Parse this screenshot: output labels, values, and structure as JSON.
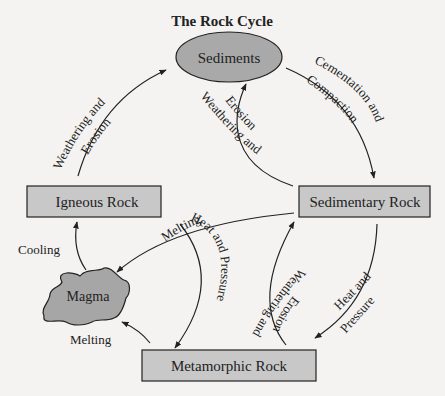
{
  "title": "The Rock Cycle",
  "nodes": {
    "sediments": "Sediments",
    "igneous": "Igneous Rock",
    "sedimentary": "Sedimentary Rock",
    "magma": "Magma",
    "metamorphic": "Metamorphic Rock"
  },
  "edges": {
    "igneous_to_sediments": [
      "Weathering and",
      "Erosion"
    ],
    "sediments_to_sedimentary": [
      "Cementation and",
      "Compaction"
    ],
    "sedimentary_to_sediments": [
      "Weathering and",
      "Erosion"
    ],
    "sedimentary_to_magma": "Melting",
    "igneous_to_metamorphic": "Heat and Pressure",
    "metamorphic_to_sedimentary": [
      "Weathering and",
      "Erosion"
    ],
    "sedimentary_to_metamorphic": [
      "Heat and",
      "Pressure"
    ],
    "magma_to_igneous": "Cooling",
    "metamorphic_to_magma": "Melting"
  },
  "colors": {
    "node_fill": "#c8c8c8",
    "oval_fill": "#a9a9a9",
    "magma_fill": "#a6a6a6",
    "stroke": "#222222",
    "background": "#f4f3f1"
  }
}
